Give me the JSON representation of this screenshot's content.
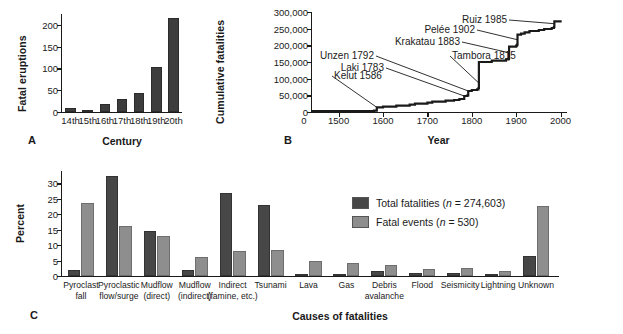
{
  "figure": {
    "colors": {
      "total": "#474747",
      "events": "#8e8e8e",
      "axis": "#1a1a1a"
    }
  },
  "panelA": {
    "letter": "A",
    "ylabel": "Fatal eruptions",
    "xlabel": "Century",
    "chart_data": {
      "type": "bar",
      "title": "Fatal eruptions by century",
      "xlabel": "Century",
      "ylabel": "Fatal eruptions",
      "categories": [
        "14th",
        "15th",
        "16th",
        "17th",
        "18th",
        "19th",
        "20th"
      ],
      "values": [
        9,
        4,
        19,
        30,
        43,
        104,
        215
      ],
      "yticks": [
        0,
        50,
        100,
        150,
        200
      ],
      "ylim": [
        0,
        225
      ],
      "grid": false,
      "legend": "none"
    }
  },
  "panelB": {
    "letter": "B",
    "ylabel": "Cumulative fatalities",
    "xlabel": "Year",
    "chart_data": {
      "type": "line",
      "title": "Cumulative volcanic fatalities through time",
      "xlabel": "Year",
      "ylabel": "Cumulative fatalities",
      "yticks": [
        0,
        50000,
        100000,
        150000,
        200000,
        250000,
        300000
      ],
      "ytick_labels": [
        "0",
        "50,000",
        "100,000",
        "150,000",
        "200,000",
        "250,000",
        "300,000"
      ],
      "xticks": [
        1500,
        1600,
        1700,
        1800,
        1900,
        2000
      ],
      "xtick_labels": [
        "1500",
        "1600",
        "1700",
        "1800",
        "1900",
        "2000"
      ],
      "x_origin_label": "0",
      "xlim": [
        1440,
        2010
      ],
      "ylim": [
        0,
        300000
      ],
      "grid": false,
      "series": [
        {
          "name": "Cumulative fatalities",
          "x": [
            1440,
            1580,
            1586,
            1600,
            1630,
            1660,
            1672,
            1700,
            1711,
            1741,
            1760,
            1772,
            1783,
            1790,
            1792,
            1800,
            1812,
            1815,
            1816,
            1845,
            1877,
            1883,
            1884,
            1900,
            1902,
            1903,
            1911,
            1919,
            1930,
            1951,
            1963,
            1980,
            1985,
            1986,
            2000
          ],
          "y": [
            3000,
            4000,
            14000,
            16000,
            19000,
            22000,
            25000,
            28000,
            31000,
            34000,
            36000,
            39000,
            48000,
            50000,
            63000,
            66000,
            68000,
            72000,
            150000,
            154000,
            158000,
            160000,
            196000,
            199000,
            202000,
            232000,
            235000,
            239000,
            243000,
            246000,
            249000,
            252000,
            255000,
            272000,
            275000
          ]
        }
      ],
      "annotations": [
        {
          "label": "Kelut 1586",
          "x": 1586,
          "y": 14000
        },
        {
          "label": "Laki 1783",
          "x": 1783,
          "y": 48000
        },
        {
          "label": "Unzen 1792",
          "x": 1792,
          "y": 63000
        },
        {
          "label": "Tambora 1815",
          "x": 1815,
          "y": 90000
        },
        {
          "label": "Krakatau 1883",
          "x": 1883,
          "y": 178000
        },
        {
          "label": "Pelée 1902",
          "x": 1902,
          "y": 217000
        },
        {
          "label": "Ruiz 1985",
          "x": 1985,
          "y": 265000
        }
      ]
    }
  },
  "panelC": {
    "letter": "C",
    "ylabel": "Percent",
    "xlabel": "Causes of fatalities",
    "legend": [
      {
        "label": "Total fatalities (",
        "italic": "n",
        "tail": " = 274,603)",
        "key": "total"
      },
      {
        "label": "Fatal events (",
        "italic": "n",
        "tail": " = 530)",
        "key": "events"
      }
    ],
    "chart_data": {
      "type": "bar",
      "title": "Percent of fatalities and fatal events by cause",
      "xlabel": "Causes of fatalities",
      "ylabel": "Percent",
      "yticks": [
        0,
        5,
        10,
        15,
        20,
        25,
        30
      ],
      "ylim": [
        0,
        34
      ],
      "grid": false,
      "legend_position": "upper-right-inside",
      "categories": [
        "Pyroclast fall",
        "Pyroclastic flow/surge",
        "Mudflow (direct)",
        "Mudflow (indirect)",
        "Indirect (famine, etc.)",
        "Tsunami",
        "Lava",
        "Gas",
        "Debris avalanche",
        "Flood",
        "Seismicity",
        "Lightning",
        "Unknown"
      ],
      "category_lines": [
        [
          "Pyroclast",
          "fall"
        ],
        [
          "Pyroclastic",
          "flow/surge"
        ],
        [
          "Mudflow",
          "(direct)"
        ],
        [
          "Mudflow",
          "(indirect)"
        ],
        [
          "Indirect",
          "(famine, etc.)"
        ],
        [
          "Tsunami",
          ""
        ],
        [
          "Lava",
          ""
        ],
        [
          "Gas",
          ""
        ],
        [
          "Debris",
          "avalanche"
        ],
        [
          "Flood",
          ""
        ],
        [
          "Seismicity",
          ""
        ],
        [
          "Lightning",
          ""
        ],
        [
          "Unknown",
          ""
        ]
      ],
      "series": [
        {
          "name": "Total fatalities (n = 274,603)",
          "values": [
            2.1,
            32.5,
            14.6,
            2.1,
            26.8,
            23.1,
            0.5,
            0.7,
            1.6,
            0.9,
            0.9,
            0.3,
            6.6
          ]
        },
        {
          "name": "Fatal events (n = 530)",
          "values": [
            23.8,
            16.3,
            13.0,
            6.0,
            8.2,
            8.4,
            5.0,
            4.2,
            3.6,
            2.4,
            2.6,
            1.5,
            22.6
          ]
        }
      ]
    }
  }
}
